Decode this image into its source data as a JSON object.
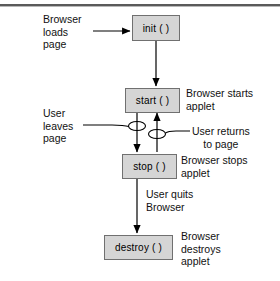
{
  "figure": {
    "colors": {
      "box_fill": "#d5d5d5",
      "box_border": "#707070",
      "line": "#000000",
      "rule": "#5a5a5a",
      "text": "#111111",
      "background": "#ffffff"
    }
  },
  "nodes": [
    {
      "id": "init",
      "label": "init ( )"
    },
    {
      "id": "start",
      "label": "start ( )"
    },
    {
      "id": "stop",
      "label": "stop ( )"
    },
    {
      "id": "destroy",
      "label": "destroy ( )"
    }
  ],
  "labels": {
    "browser_loads_page": "Browser\nloads\npage",
    "browser_starts_applet": "Browser starts\napplet",
    "user_leaves_page": "User\nleaves\npage",
    "user_returns_to_page": "User returns\nto page",
    "browser_stops_applet": "Browser stops\napplet",
    "user_quits_browser": "User quits\nBrowser",
    "browser_destroys_applet": "Browser\ndestroys\napplet"
  },
  "connectors": [
    {
      "id": "loads-to-init",
      "from": "Browser loads page",
      "to": "init ( )",
      "direction": "right"
    },
    {
      "id": "init-to-start",
      "from": "init ( )",
      "to": "start ( )",
      "direction": "down"
    },
    {
      "id": "start-to-stop",
      "from": "start ( )",
      "to": "stop ( )",
      "direction": "down"
    },
    {
      "id": "stop-to-start",
      "from": "stop ( )",
      "to": "start ( )",
      "direction": "up"
    },
    {
      "id": "stop-to-destroy",
      "from": "stop ( )",
      "to": "destroy ( )",
      "direction": "down"
    },
    {
      "id": "leaves-to-node",
      "from": "User leaves page",
      "to": "start-to-stop transition",
      "direction": "curve-right"
    },
    {
      "id": "returns-to-node",
      "from": "User returns to page",
      "to": "stop-to-start transition",
      "direction": "curve-left"
    }
  ]
}
